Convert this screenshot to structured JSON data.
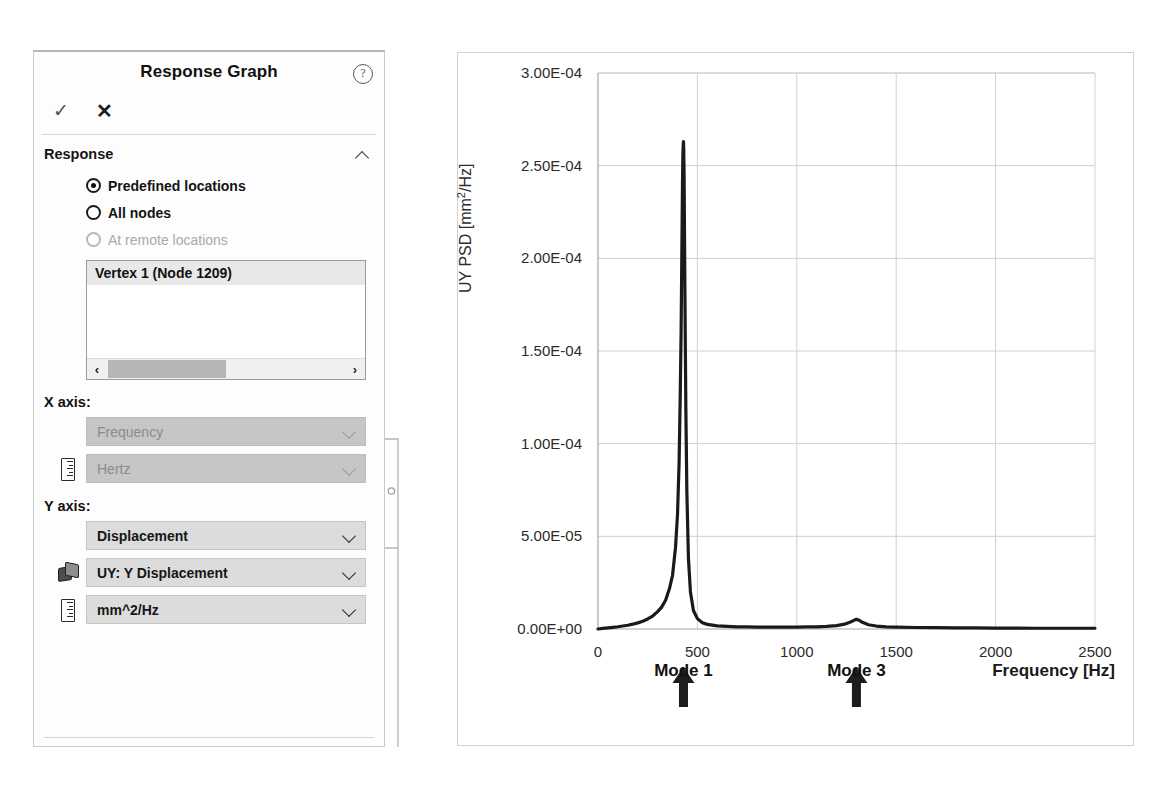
{
  "panel": {
    "title": "Response Graph",
    "help_icon": "help-circle-icon",
    "accept_label": "✓",
    "cancel_label": "✕",
    "section": {
      "title": "Response",
      "collapse_icon": "chevron-up-icon"
    },
    "radios": [
      {
        "label": "Predefined locations",
        "checked": true,
        "disabled": false
      },
      {
        "label": "All nodes",
        "checked": false,
        "disabled": false
      },
      {
        "label": "At remote locations",
        "checked": false,
        "disabled": true
      }
    ],
    "location_list": {
      "items": [
        "Vertex 1 (Node 1209)"
      ],
      "scroll_left_icon": "‹",
      "scroll_right_icon": "›"
    },
    "x_axis": {
      "label": "X axis:",
      "quantity": {
        "value": "Frequency",
        "disabled": true
      },
      "unit": {
        "value": "Hertz",
        "disabled": true,
        "icon": "ruler-icon"
      }
    },
    "y_axis": {
      "label": "Y axis:",
      "quantity": {
        "value": "Displacement",
        "disabled": false
      },
      "component": {
        "value": "UY: Y Displacement",
        "disabled": false,
        "icon": "result-cube-icon"
      },
      "unit": {
        "value": "mm^2/Hz",
        "disabled": false,
        "icon": "ruler-icon"
      }
    }
  },
  "chart_data": {
    "type": "line",
    "title": "",
    "xlabel": "Frequency [Hz]",
    "ylabel": "UY PSD [mm2/Hz]",
    "ylabel_display": "UY PSD [mm²/Hz]",
    "xlim": [
      0,
      2500
    ],
    "ylim": [
      0,
      0.0003
    ],
    "grid": true,
    "legend": "none",
    "xticks": [
      0,
      500,
      1000,
      1500,
      2000,
      2500
    ],
    "xticklabels": [
      "0",
      "500",
      "1000",
      "1500",
      "2000",
      "2500"
    ],
    "yticks": [
      0,
      5e-05,
      0.0001,
      0.00015,
      0.0002,
      0.00025,
      0.0003
    ],
    "yticklabels": [
      "0.00E+00",
      "5.00E-05",
      "1.00E-04",
      "1.50E-04",
      "2.00E-04",
      "2.50E-04",
      "3.00E-04"
    ],
    "series": [
      {
        "name": "UY PSD",
        "color": "#1a1a1a",
        "x": [
          0,
          25,
          50,
          75,
          100,
          125,
          150,
          175,
          200,
          225,
          250,
          275,
          300,
          320,
          340,
          360,
          375,
          390,
          400,
          408,
          414,
          418,
          422,
          425,
          427,
          429,
          430,
          431,
          433,
          435,
          438,
          442,
          447,
          455,
          465,
          480,
          500,
          525,
          550,
          600,
          650,
          700,
          750,
          800,
          850,
          900,
          950,
          1000,
          1050,
          1100,
          1150,
          1200,
          1240,
          1270,
          1290,
          1300,
          1310,
          1330,
          1360,
          1400,
          1450,
          1500,
          1600,
          1700,
          1800,
          1900,
          2000,
          2100,
          2200,
          2300,
          2400,
          2500
        ],
        "y": [
          0.0,
          3e-07,
          6e-07,
          9e-07,
          1.2e-06,
          1.6e-06,
          2e-06,
          2.6e-06,
          3.3e-06,
          4.2e-06,
          5.4e-06,
          7e-06,
          9.4e-06,
          1.18e-05,
          1.55e-05,
          2.2e-05,
          2.9e-05,
          4.4e-05,
          6.2e-05,
          9e-05,
          0.000128,
          0.00016,
          0.000205,
          0.00024,
          0.000256,
          0.000262,
          0.000263,
          0.00026,
          0.000246,
          0.000215,
          0.00017,
          0.000118,
          7.4e-05,
          3.8e-05,
          2e-05,
          1e-05,
          5.6e-06,
          3.4e-06,
          2.5e-06,
          1.7e-06,
          1.4e-06,
          1.2e-06,
          1.1e-06,
          1e-06,
          1e-06,
          1e-06,
          1e-06,
          1e-06,
          1.1e-06,
          1.2e-06,
          1.4e-06,
          1.8e-06,
          2.6e-06,
          3.8e-06,
          4.8e-06,
          5.2e-06,
          4.9e-06,
          3.6e-06,
          2.3e-06,
          1.6e-06,
          1.2e-06,
          1e-06,
          8e-07,
          7e-07,
          6e-07,
          6e-07,
          5e-07,
          5e-07,
          4e-07,
          4e-07,
          4e-07,
          4e-07
        ]
      }
    ],
    "annotations": [
      {
        "label": "Mode 1",
        "x": 430,
        "marker": "up-arrow"
      },
      {
        "label": "Mode 3",
        "x": 1300,
        "marker": "up-arrow"
      }
    ],
    "peaks": [
      {
        "name": "Mode 1",
        "frequency": 430,
        "value": 0.000263
      },
      {
        "name": "Mode 3",
        "frequency": 1300,
        "value": 5.2e-06
      }
    ]
  },
  "colors": {
    "curve": "#1a1a1a",
    "grid": "#d0d0d0",
    "axis": "#a6a6a6",
    "panel_border": "#d2d2d2",
    "combo_enabled": "#dcdcdc",
    "combo_disabled": "#c6c6c6"
  }
}
